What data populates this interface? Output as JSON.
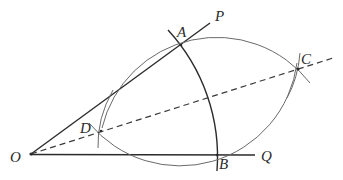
{
  "figure": {
    "colors": {
      "ray": "#2b2b2b",
      "arc_main": "#2b2b2b",
      "arc_lens": "#6a6a6a",
      "bisector": "#3a3a3a",
      "label": "#2a2a2a"
    },
    "points": {
      "O": {
        "label": "O",
        "x": 31,
        "y": 154
      },
      "A": {
        "label": "A",
        "x": 181,
        "y": 45
      },
      "B": {
        "label": "B",
        "x": 217,
        "y": 155
      },
      "C": {
        "label": "C",
        "x": 298,
        "y": 69
      },
      "D": {
        "label": "D",
        "x": 101,
        "y": 131
      },
      "P": {
        "label": "P",
        "x": 210,
        "y": 23
      },
      "Q": {
        "label": "Q",
        "x": 255,
        "y": 155
      }
    },
    "labels": {
      "O": "O",
      "A": "A",
      "B": "B",
      "C": "C",
      "D": "D",
      "P": "P",
      "Q": "Q"
    },
    "elements": [
      {
        "type": "ray",
        "name": "OP",
        "from": "O",
        "to": "P",
        "style": "solid"
      },
      {
        "type": "ray",
        "name": "OQ",
        "from": "O",
        "to": "Q",
        "style": "solid"
      },
      {
        "type": "arc",
        "name": "arc-AB",
        "center": "O",
        "through": [
          "A",
          "B"
        ]
      },
      {
        "type": "arc",
        "name": "upper-lens-arc",
        "center": "B",
        "through": [
          "D",
          "C"
        ]
      },
      {
        "type": "arc",
        "name": "lower-lens-arc",
        "center": "A",
        "through": [
          "D",
          "C"
        ]
      },
      {
        "type": "arc",
        "name": "tick-arc-C",
        "near": "C"
      },
      {
        "type": "arc",
        "name": "tick-arc-D",
        "near": "D"
      },
      {
        "type": "line",
        "name": "bisector-OC",
        "from": "O",
        "through": [
          "D",
          "C"
        ],
        "style": "dashed"
      }
    ]
  }
}
